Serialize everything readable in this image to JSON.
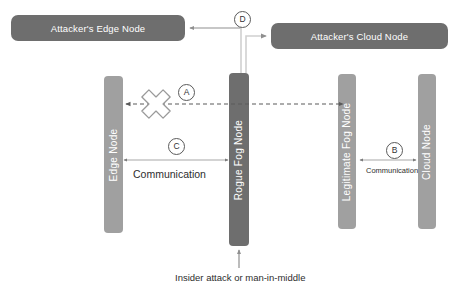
{
  "diagram": {
    "colors": {
      "background": "#ffffff",
      "attacker_box_fill": "#6e6e6e",
      "rogue_node_fill": "#6e6e6e",
      "normal_node_fill": "#a0a0a0",
      "node_label_text": "#ffffff",
      "line": "#9a9a9a",
      "dashed_line": "#5a5a5a",
      "caption_text": "#2d2d2d",
      "marker_border": "#5a5a5a"
    },
    "attacker_nodes": [
      {
        "id": "attacker-edge-node",
        "label": "Attacker's Edge Node"
      },
      {
        "id": "attacker-cloud-node",
        "label": "Attacker's Cloud Node"
      }
    ],
    "node_bars": [
      {
        "id": "edge-node",
        "label": "Edge Node",
        "fill": "#a0a0a0"
      },
      {
        "id": "rogue-fog-node",
        "label": "Rogue Fog Node",
        "fill": "#6e6e6e"
      },
      {
        "id": "legitimate-fog-node",
        "label": "Legitimate  Fog Node",
        "fill": "#a0a0a0"
      },
      {
        "id": "cloud-node",
        "label": "Cloud Node",
        "fill": "#a0a0a0"
      }
    ],
    "markers": [
      {
        "id": "a",
        "label": "A",
        "describes": "blocked dashed link between Edge Node and Rogue Fog Node"
      },
      {
        "id": "b",
        "label": "B",
        "describes": "communication between Legitimate Fog Node and Cloud Node"
      },
      {
        "id": "c",
        "label": "C",
        "describes": "communication between Edge Node and Rogue Fog Node"
      },
      {
        "id": "d",
        "label": "D",
        "describes": "rogue fog node links to attacker nodes"
      }
    ],
    "labels": {
      "communication_left": "Communication",
      "communication_right": "Communication",
      "caption": "Insider attack or man-in-middle"
    },
    "blocked_icon": {
      "name": "blocked-cross-icon",
      "glyph": "X"
    }
  }
}
